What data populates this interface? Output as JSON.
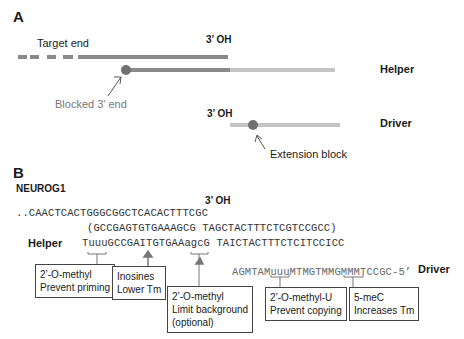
{
  "panel_a": {
    "label": "A",
    "target_end_label": "Target end",
    "helper_3oh": "3’ OH",
    "helper_label": "Helper",
    "blocked_label": "Blocked 3’ end",
    "driver_3oh": "3’ OH",
    "driver_label": "Driver",
    "extension_label": "Extension block"
  },
  "panel_b": {
    "label": "B",
    "gene": "NEUROG1",
    "target_3oh": "3’ OH",
    "target_seq": "..CAACTCACTGGGCGGCTCACACTTTCGC",
    "template_seq": "(GCCGAGTGTGAAAGCG TAGCTACTTTCTCGTCCGCC)",
    "helper_label": "Helper",
    "helper_seq": "TuuuGCCGAITGTGAAagcG TAICTACTTTCTCITCCICC",
    "driver_seq": "AGMTAMuuuMTMGTMMGMMMTCCGC-5’",
    "driver_label": "Driver",
    "annotations": [
      {
        "line1": "2’-O-methyl",
        "line2": "Prevent priming"
      },
      {
        "line1": "Inosines",
        "line2": "Lower Tm"
      },
      {
        "line1": "2’-O-methyl",
        "line2": "Limit background",
        "line3": "(optional)"
      },
      {
        "line1": "2’-O-methyl-U",
        "line2": "Prevent copying"
      },
      {
        "line1": "5-meC",
        "line2": "Increases Tm"
      }
    ]
  },
  "colors": {
    "dark_strand": "#8a8a8a",
    "light_strand": "#c4c4c4",
    "block_dot": "#707070"
  }
}
